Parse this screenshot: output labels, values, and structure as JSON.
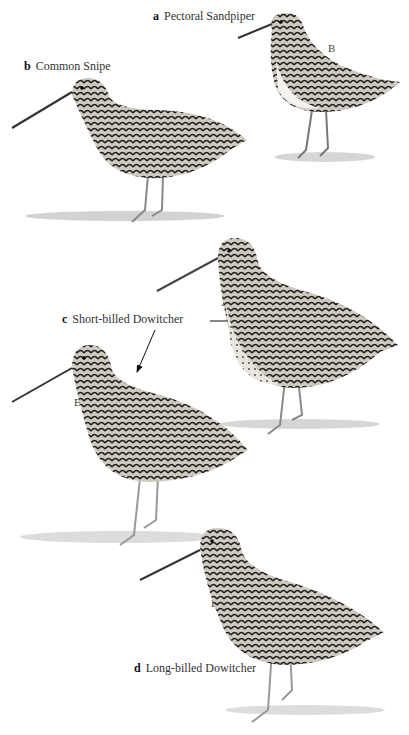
{
  "plate": {
    "species": [
      {
        "letter": "a",
        "name": "Pectoral Sandpiper",
        "plumage_tag": "B"
      },
      {
        "letter": "b",
        "name": "Common Snipe",
        "plumage_tag": ""
      },
      {
        "letter": "c",
        "name": "Short-billed Dowitcher",
        "plumage_tags": [
          "J",
          "B"
        ]
      },
      {
        "letter": "d",
        "name": "Long-billed Dowitcher",
        "plumage_tag": "B"
      }
    ]
  }
}
